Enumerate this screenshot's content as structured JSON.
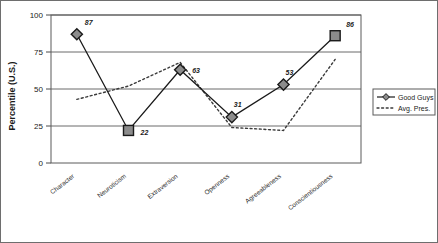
{
  "chart_data": {
    "type": "line",
    "title": "",
    "xlabel": "",
    "ylabel": "Percentile (U.S.)",
    "ylim": [
      0,
      100
    ],
    "yticks": [
      0,
      25,
      50,
      75,
      100
    ],
    "grid": true,
    "legend_position": "right",
    "categories": [
      "Character",
      "Neuroticism",
      "Extraversion",
      "Openness",
      "Agreeableness",
      "Conscientiousness"
    ],
    "series": [
      {
        "name": "Good Guys",
        "style": "solid",
        "marker": "diamond",
        "values": [
          87,
          22,
          63,
          31,
          53,
          86
        ],
        "point_labels": [
          "87",
          "22",
          "63",
          "31",
          "53",
          "86"
        ],
        "marker_shapes": [
          "diamond",
          "square",
          "diamond",
          "diamond",
          "diamond",
          "square"
        ],
        "color": "#1a1a1a",
        "marker_fill": "#8c8c8c"
      },
      {
        "name": "Avg. Pres.",
        "style": "dotted",
        "marker": "none",
        "values": [
          43,
          52,
          68,
          24,
          22,
          70
        ],
        "point_labels": [],
        "color": "#3a3a3a"
      }
    ]
  },
  "axis": {
    "y_title": "Percentile (U.S.)",
    "y_tick_labels": [
      "100",
      "75",
      "50",
      "25",
      "0"
    ]
  },
  "legend": {
    "entries": [
      {
        "label": "Good Guys",
        "style": "solid",
        "marker": "diamond"
      },
      {
        "label": "Avg. Pres.",
        "style": "dotted",
        "marker": "none"
      }
    ]
  },
  "colors": {
    "line": "#1a1a1a",
    "dotted": "#3a3a3a",
    "marker_fill": "#8c8c8c",
    "grid": "#6a6a6a",
    "frame": "#5a5a5a",
    "border": "#6e6e6e",
    "background": "#ffffff"
  }
}
